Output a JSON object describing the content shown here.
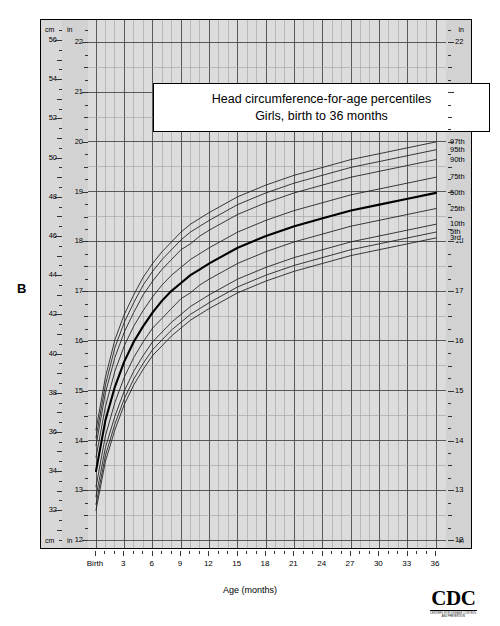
{
  "panel": {
    "letter": "B"
  },
  "title": {
    "line1": "Head circumference-for-age percentiles",
    "line2": "Girls, birth to 36 months"
  },
  "axes": {
    "left_unit_top": "cm",
    "left_unit_bottom": "cm",
    "inch_unit_top": "in",
    "inch_unit_bottom": "in",
    "right_unit_top": "in",
    "right_unit_bottom": "in",
    "x_title": "Age (months)",
    "x_first_label": "Birth",
    "cm_ticks": [
      30,
      32,
      34,
      36,
      38,
      40,
      42,
      44,
      46,
      48,
      50,
      52,
      54,
      56
    ],
    "in_ticks": [
      12,
      13,
      14,
      15,
      16,
      17,
      18,
      19,
      20,
      21,
      22
    ],
    "x_ticks": [
      "Birth",
      "3",
      "6",
      "9",
      "12",
      "15",
      "18",
      "21",
      "24",
      "27",
      "30",
      "33",
      "36"
    ]
  },
  "logo": {
    "word": "CDC",
    "tagline_line1": "CENTERS FOR DISEASE CONTROL",
    "tagline_line2": "AND PREVENTION"
  },
  "colors": {
    "plot_background": "#dcdcdc",
    "gutter": "#d2d2d2",
    "grid_minor": "#9a9a9a",
    "grid_major": "#4a4a4a",
    "curve": "#1a1a1a",
    "curve_median": "#000000",
    "frame": "#000000"
  },
  "chart_data": {
    "type": "line",
    "xlabel": "Age (months)",
    "ylabel": "Head circumference (cm / in)",
    "xlim": [
      0,
      36
    ],
    "ylim_cm": [
      30,
      57
    ],
    "ylim_in": [
      11.8,
      22.4
    ],
    "grid": true,
    "legend_position": "right-inline",
    "x": [
      0,
      1,
      2,
      3,
      4,
      5,
      6,
      7,
      8,
      9,
      10,
      11,
      12,
      15,
      18,
      21,
      24,
      27,
      30,
      33,
      36
    ],
    "units": "cm",
    "series": [
      {
        "name": "97th",
        "label": "97th",
        "values": [
          36.1,
          38.8,
          40.7,
          42.0,
          43.0,
          43.9,
          44.6,
          45.2,
          45.7,
          46.2,
          46.6,
          46.9,
          47.2,
          48.0,
          48.6,
          49.1,
          49.5,
          49.9,
          50.2,
          50.5,
          50.8
        ]
      },
      {
        "name": "95th",
        "label": "95th",
        "values": [
          35.7,
          38.4,
          40.3,
          41.6,
          42.6,
          43.5,
          44.2,
          44.8,
          45.3,
          45.8,
          46.2,
          46.5,
          46.8,
          47.6,
          48.2,
          48.7,
          49.1,
          49.5,
          49.8,
          50.1,
          50.4
        ]
      },
      {
        "name": "90th",
        "label": "90th",
        "values": [
          35.3,
          38.0,
          39.8,
          41.1,
          42.1,
          43.0,
          43.7,
          44.3,
          44.8,
          45.3,
          45.6,
          46.0,
          46.3,
          47.1,
          47.7,
          48.2,
          48.6,
          49.0,
          49.3,
          49.6,
          49.9
        ]
      },
      {
        "name": "75th",
        "label": "75th",
        "values": [
          34.7,
          37.3,
          39.1,
          40.4,
          41.4,
          42.2,
          42.9,
          43.5,
          44.0,
          44.4,
          44.8,
          45.1,
          45.4,
          46.2,
          46.8,
          47.3,
          47.7,
          48.1,
          48.4,
          48.7,
          49.0
        ]
      },
      {
        "name": "50th",
        "label": "50th",
        "emphasis": true,
        "values": [
          34.0,
          36.6,
          38.3,
          39.6,
          40.6,
          41.4,
          42.1,
          42.7,
          43.2,
          43.6,
          44.0,
          44.3,
          44.6,
          45.4,
          46.0,
          46.5,
          46.9,
          47.3,
          47.6,
          47.9,
          48.2
        ]
      },
      {
        "name": "25th",
        "label": "25th",
        "values": [
          33.2,
          35.8,
          37.5,
          38.8,
          39.8,
          40.6,
          41.3,
          41.8,
          42.3,
          42.8,
          43.1,
          43.5,
          43.8,
          44.6,
          45.2,
          45.7,
          46.1,
          46.5,
          46.8,
          47.1,
          47.4
        ]
      },
      {
        "name": "10th",
        "label": "10th",
        "values": [
          32.7,
          35.2,
          36.8,
          38.1,
          39.1,
          39.9,
          40.6,
          41.1,
          41.6,
          42.0,
          42.4,
          42.7,
          43.0,
          43.8,
          44.4,
          44.9,
          45.3,
          45.7,
          46.0,
          46.3,
          46.6
        ]
      },
      {
        "name": "5th",
        "label": "5th",
        "values": [
          32.3,
          34.8,
          36.4,
          37.7,
          38.7,
          39.5,
          40.2,
          40.7,
          41.2,
          41.6,
          42.0,
          42.3,
          42.6,
          43.4,
          44.0,
          44.5,
          44.9,
          45.3,
          45.6,
          45.9,
          46.2
        ]
      },
      {
        "name": "3rd",
        "label": "3rd",
        "values": [
          32.0,
          34.5,
          36.1,
          37.4,
          38.4,
          39.2,
          39.9,
          40.4,
          40.9,
          41.3,
          41.7,
          42.0,
          42.3,
          43.1,
          43.7,
          44.2,
          44.6,
          45.0,
          45.3,
          45.6,
          45.9
        ]
      }
    ]
  }
}
